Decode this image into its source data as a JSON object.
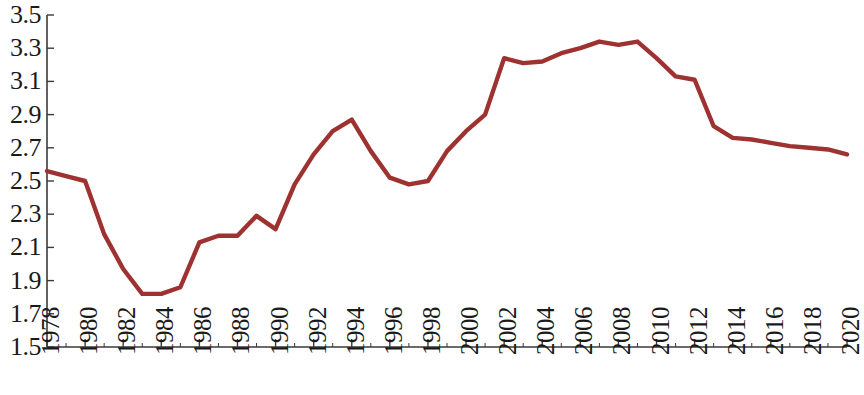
{
  "chart_data": {
    "type": "line",
    "title": "",
    "subtitle": "",
    "xlabel": "",
    "ylabel": "",
    "grid": false,
    "legend": "none",
    "line_color": "#9E3231",
    "axis_color": "#3a3a3a",
    "background_color": "#ffffff",
    "xlim": [
      1978,
      2020
    ],
    "ylim": [
      1.5,
      3.5
    ],
    "ytick_step": 0.2,
    "xtick_step": 2,
    "ytick_labels": [
      "3.5",
      "3.3",
      "3.1",
      "2.9",
      "2.7",
      "2.5",
      "2.3",
      "2.1",
      "1.9",
      "1.7",
      "1.5"
    ],
    "ytick_values": [
      3.5,
      3.3,
      3.1,
      2.9,
      2.7,
      2.5,
      2.3,
      2.1,
      1.9,
      1.7,
      1.5
    ],
    "xtick_labels": [
      "1978",
      "1980",
      "1982",
      "1984",
      "1986",
      "1988",
      "1990",
      "1992",
      "1994",
      "1996",
      "1998",
      "2000",
      "2002",
      "2004",
      "2006",
      "2008",
      "2010",
      "2012",
      "2014",
      "2016",
      "2018",
      "2020"
    ],
    "xtick_values": [
      1978,
      1980,
      1982,
      1984,
      1986,
      1988,
      1990,
      1992,
      1994,
      1996,
      1998,
      2000,
      2002,
      2004,
      2006,
      2008,
      2010,
      2012,
      2014,
      2016,
      2018,
      2020
    ],
    "x": [
      1978,
      1979,
      1980,
      1981,
      1982,
      1983,
      1984,
      1985,
      1986,
      1987,
      1988,
      1989,
      1990,
      1991,
      1992,
      1993,
      1994,
      1995,
      1996,
      1997,
      1998,
      1999,
      2000,
      2001,
      2002,
      2003,
      2004,
      2005,
      2006,
      2007,
      2008,
      2009,
      2010,
      2011,
      2012,
      2013,
      2014,
      2015,
      2016,
      2017,
      2018,
      2019,
      2020
    ],
    "values": [
      2.56,
      2.53,
      2.5,
      2.18,
      1.97,
      1.82,
      1.82,
      1.86,
      2.13,
      2.17,
      2.17,
      2.29,
      2.21,
      2.48,
      2.66,
      2.8,
      2.87,
      2.68,
      2.52,
      2.48,
      2.5,
      2.68,
      2.8,
      2.9,
      3.24,
      3.21,
      3.22,
      3.27,
      3.3,
      3.34,
      3.32,
      3.34,
      3.24,
      3.13,
      3.11,
      2.83,
      2.76,
      2.75,
      2.73,
      2.71,
      2.7,
      2.69,
      2.66
    ],
    "series": [
      {
        "name": "series-1",
        "color": "#9E3231",
        "values": [
          2.56,
          2.53,
          2.5,
          2.18,
          1.97,
          1.82,
          1.82,
          1.86,
          2.13,
          2.17,
          2.17,
          2.29,
          2.21,
          2.48,
          2.66,
          2.8,
          2.87,
          2.68,
          2.52,
          2.48,
          2.5,
          2.68,
          2.8,
          2.9,
          3.24,
          3.21,
          3.22,
          3.27,
          3.3,
          3.34,
          3.32,
          3.34,
          3.24,
          3.13,
          3.11,
          2.83,
          2.76,
          2.75,
          2.73,
          2.71,
          2.7,
          2.69,
          2.66
        ]
      }
    ]
  }
}
